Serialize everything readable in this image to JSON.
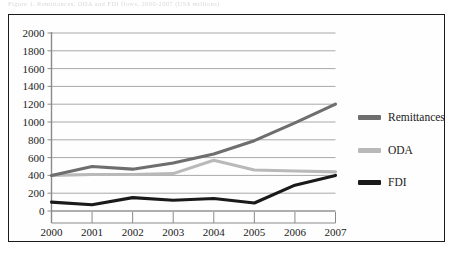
{
  "caption": {
    "text": "Figure 1.  Remittances, ODA and FDI flows, 2000-2007 (US$ millions)"
  },
  "chart_data": {
    "type": "line",
    "title": "",
    "xlabel": "",
    "ylabel": "",
    "categories": [
      "2000",
      "2001",
      "2002",
      "2003",
      "2004",
      "2005",
      "2006",
      "2007"
    ],
    "x": [
      2000,
      2001,
      2002,
      2003,
      2004,
      2005,
      2006,
      2007
    ],
    "ylim": [
      0,
      2000
    ],
    "yticks": [
      0,
      200,
      400,
      600,
      800,
      1000,
      1200,
      1400,
      1600,
      1800,
      2000
    ],
    "ytick_labels": [
      "0",
      "200",
      "400",
      "600",
      "800",
      "1000",
      "1200",
      "1400",
      "1600",
      "1800",
      "2000"
    ],
    "grid": true,
    "legend_position": "right",
    "series": [
      {
        "name": "Remittances",
        "color": "#6e6e6e",
        "values": [
          400,
          500,
          470,
          540,
          640,
          790,
          990,
          1200
        ]
      },
      {
        "name": "ODA",
        "color": "#b9b9b9",
        "values": [
          400,
          410,
          410,
          420,
          570,
          460,
          450,
          440
        ]
      },
      {
        "name": "FDI",
        "color": "#1a1a1a",
        "values": [
          100,
          70,
          150,
          120,
          140,
          90,
          290,
          400
        ]
      }
    ]
  },
  "legend": {
    "items": [
      {
        "label": "Remittances",
        "color": "#6e6e6e"
      },
      {
        "label": "ODA",
        "color": "#b9b9b9"
      },
      {
        "label": "FDI",
        "color": "#1a1a1a"
      }
    ]
  },
  "axes": {
    "axis_color": "#8a8a8a",
    "grid_color": "#a8a8a8",
    "tick_font_size": 11
  }
}
